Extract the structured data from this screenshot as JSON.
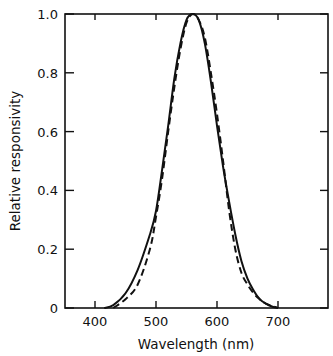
{
  "chart_data": {
    "type": "line",
    "title": "",
    "xlabel": "Wavelength (nm)",
    "ylabel": "Relative responsivity",
    "xlim": [
      350,
      780
    ],
    "ylim": [
      0,
      1.0
    ],
    "xticks": [
      400,
      500,
      600,
      700
    ],
    "xtick_labels": [
      "400",
      "500",
      "600",
      "700"
    ],
    "yticks": [
      0,
      0.2,
      0.4,
      0.6,
      0.8,
      1.0
    ],
    "ytick_labels": [
      "0",
      "0.2",
      "0.4",
      "0.6",
      "0.8",
      "1.0"
    ],
    "grid": false,
    "legend": null,
    "series": [
      {
        "name": "solid",
        "style": "solid",
        "x": [
          415,
          430,
          450,
          470,
          490,
          500,
          510,
          520,
          530,
          540,
          550,
          560,
          570,
          580,
          590,
          600,
          610,
          620,
          630,
          640,
          650,
          660,
          670,
          680,
          690,
          700
        ],
        "y": [
          0,
          0.01,
          0.05,
          0.13,
          0.25,
          0.33,
          0.47,
          0.62,
          0.78,
          0.9,
          0.98,
          1.0,
          0.98,
          0.9,
          0.77,
          0.62,
          0.48,
          0.36,
          0.25,
          0.16,
          0.1,
          0.06,
          0.03,
          0.015,
          0.005,
          0
        ]
      },
      {
        "name": "dashed",
        "style": "dashed",
        "x": [
          430,
          450,
          470,
          490,
          500,
          510,
          520,
          530,
          540,
          550,
          560,
          570,
          580,
          590,
          600,
          610,
          620,
          630,
          640,
          650,
          660,
          670,
          680,
          700
        ],
        "y": [
          0,
          0.03,
          0.08,
          0.2,
          0.31,
          0.44,
          0.6,
          0.75,
          0.88,
          0.97,
          1.0,
          0.98,
          0.92,
          0.8,
          0.66,
          0.5,
          0.33,
          0.2,
          0.12,
          0.08,
          0.05,
          0.03,
          0.015,
          0
        ]
      }
    ]
  }
}
